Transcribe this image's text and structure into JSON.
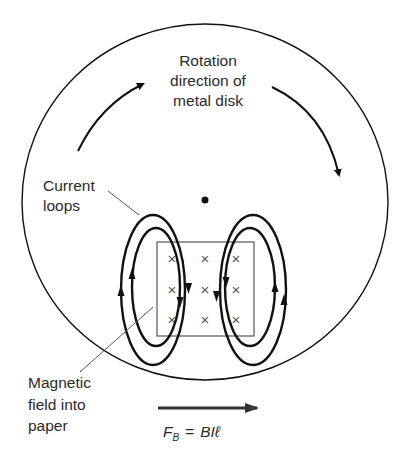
{
  "figure": {
    "type": "eddy-current-brake-diagram",
    "disk_label": {
      "line1": "Rotation",
      "line2": "direction of",
      "line3": "metal disk"
    },
    "current_loops_label": {
      "line1": "Current",
      "line2": "loops"
    },
    "magnetic_field_label": {
      "line1": "Magnetic",
      "line2": "field into",
      "line3": "paper"
    },
    "force_label": {
      "lhs": "F",
      "lhs_subscript": "B",
      "equals": "=",
      "rhs": "BIℓ"
    },
    "field_symbol": "×",
    "field_grid": {
      "rows": 3,
      "cols": 3
    },
    "colors": {
      "line": "#111111",
      "thin_line": "#444444",
      "text": "#2a2a2a",
      "background": "#ffffff"
    }
  }
}
